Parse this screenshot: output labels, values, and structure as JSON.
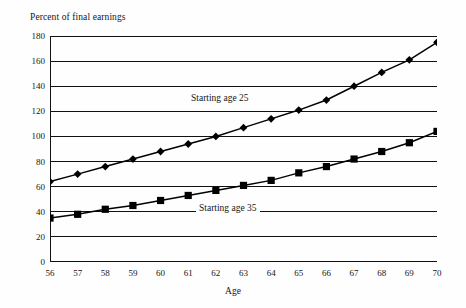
{
  "chart_data": {
    "type": "line",
    "title": "",
    "ylabel": "Percent of final earnings",
    "xlabel": "Age",
    "x": [
      56,
      57,
      58,
      59,
      60,
      61,
      62,
      63,
      64,
      65,
      66,
      67,
      68,
      69,
      70
    ],
    "xtick_labels": [
      "56",
      "57",
      "58",
      "59",
      "60",
      "61",
      "62",
      "63",
      "64",
      "65",
      "66",
      "67",
      "68",
      "69",
      "70"
    ],
    "ytick_labels": [
      "0",
      "20",
      "40",
      "60",
      "80",
      "100",
      "120",
      "140",
      "160",
      "180"
    ],
    "yticks": [
      0,
      20,
      40,
      60,
      80,
      100,
      120,
      140,
      160,
      180
    ],
    "ylim": [
      0,
      180
    ],
    "xlim": [
      56,
      70
    ],
    "grid": true,
    "legend_position": "inline-annotation",
    "series": [
      {
        "name": "Starting age 25",
        "marker": "diamond",
        "color": "#000000",
        "values": [
          64,
          70,
          76,
          82,
          88,
          94,
          100,
          107,
          114,
          121,
          129,
          140,
          151,
          161,
          175
        ]
      },
      {
        "name": "Starting age 35",
        "marker": "square",
        "color": "#000000",
        "values": [
          35,
          38,
          42,
          45,
          49,
          53,
          57,
          61,
          65,
          71,
          76,
          82,
          88,
          95,
          104
        ]
      }
    ],
    "annotations": [
      {
        "text": "Starting age 25",
        "x": 61.0,
        "y": 130
      },
      {
        "text": "Starting age 35",
        "x": 61.4,
        "y": 42
      }
    ]
  }
}
